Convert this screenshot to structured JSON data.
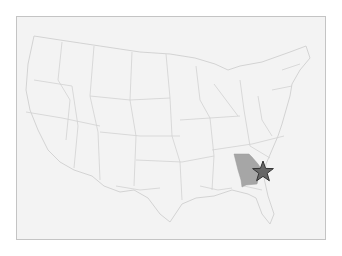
{
  "map": {
    "region": "Contiguous United States",
    "highlighted_state": "Georgia",
    "colors": {
      "background": "#f3f3f3",
      "border": "#c4c4c4",
      "state_lines": "#d2d2d2",
      "highlight_fill": "#a6a6a6",
      "marker_fill": "#666666",
      "marker_stroke": "#333333"
    },
    "marker": {
      "type": "star-icon",
      "location": "Georgia (east coast)"
    }
  }
}
